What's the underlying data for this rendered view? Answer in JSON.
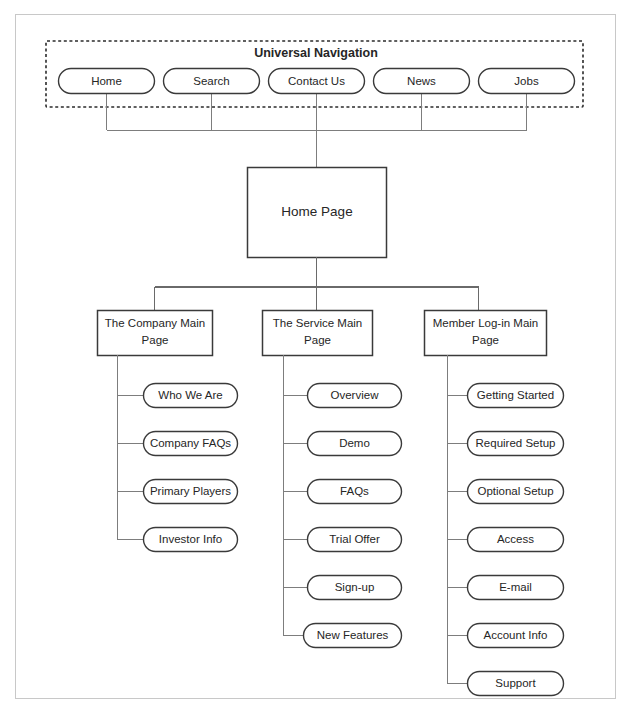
{
  "diagram": {
    "type": "sitemap",
    "universal_nav": {
      "title": "Universal Navigation",
      "items": [
        {
          "label": "Home"
        },
        {
          "label": "Search"
        },
        {
          "label": "Contact Us"
        },
        {
          "label": "News"
        },
        {
          "label": "Jobs"
        }
      ]
    },
    "root": {
      "label": "Home Page"
    },
    "sections": [
      {
        "label": "The Company Main Page",
        "line1": "The Company Main",
        "line2": "Page",
        "children": [
          {
            "label": "Who We Are"
          },
          {
            "label": "Company FAQs"
          },
          {
            "label": "Primary Players"
          },
          {
            "label": "Investor Info"
          }
        ]
      },
      {
        "label": "The Service Main Page",
        "line1": "The Service Main",
        "line2": "Page",
        "children": [
          {
            "label": "Overview"
          },
          {
            "label": "Demo"
          },
          {
            "label": "FAQs"
          },
          {
            "label": "Trial Offer"
          },
          {
            "label": "Sign-up"
          },
          {
            "label": "New Features"
          }
        ]
      },
      {
        "label": "Member Log-in Main Page",
        "line1": "Member Log-in Main",
        "line2": "Page",
        "children": [
          {
            "label": "Getting Started"
          },
          {
            "label": "Required Setup"
          },
          {
            "label": "Optional Setup"
          },
          {
            "label": "Access"
          },
          {
            "label": "E-mail"
          },
          {
            "label": "Account Info"
          },
          {
            "label": "Support"
          }
        ]
      }
    ],
    "colors": {
      "background": "#ffffff",
      "shape_stroke": "#3a3a3a",
      "connector_stroke": "#7d7d7d",
      "frame_stroke": "#c8c8c8",
      "text": "#262626"
    }
  }
}
